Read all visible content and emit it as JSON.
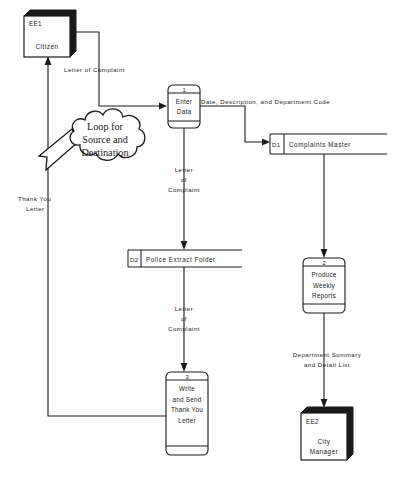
{
  "diagram": {
    "type": "data-flow-diagram",
    "annotation": {
      "line1": "Loop for",
      "line2": "Source and",
      "line3": "Destination"
    },
    "external_entities": [
      {
        "id": "EE1",
        "name": "Citizen"
      },
      {
        "id": "EE2",
        "name": "City",
        "name2": "Manager"
      }
    ],
    "processes": [
      {
        "number": "1",
        "line1": "Enter",
        "line2": "Data"
      },
      {
        "number": "2",
        "line1": "Produce",
        "line2": "Weekly",
        "line3": "Reports"
      },
      {
        "number": "3",
        "line1": "Write",
        "line2": "and Send",
        "line3": "Thank You",
        "line4": "Letter"
      }
    ],
    "data_stores": [
      {
        "id": "D1",
        "name": "Complaints Master"
      },
      {
        "id": "D2",
        "name": "Police Extract Folder"
      }
    ],
    "data_flows": [
      {
        "id": "f1",
        "label": "Letter of Complaint"
      },
      {
        "id": "f2",
        "label": "Date, Description, and Department Code"
      },
      {
        "id": "f3",
        "line1": "Letter",
        "line2": "of",
        "line3": "Complaint"
      },
      {
        "id": "f4",
        "line1": "Letter",
        "line2": "of",
        "line3": "Complaint"
      },
      {
        "id": "f5",
        "line1": "Department Summary",
        "line2": "and Detail List"
      },
      {
        "id": "f6",
        "line1": "Thank You",
        "line2": "Letter"
      }
    ],
    "colors": {
      "ink": "#1a1a1a",
      "paper": "#ffffff"
    }
  }
}
